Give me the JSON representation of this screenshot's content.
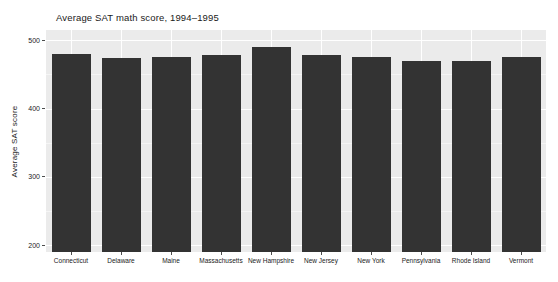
{
  "chart_data": {
    "type": "bar",
    "title": "Average SAT math score, 1994–1995",
    "xlabel": "",
    "ylabel": "Average SAT score",
    "categories": [
      "Connecticut",
      "Delaware",
      "Maine",
      "Massachusetts",
      "New Hampshire",
      "New Jersey",
      "New York",
      "Pennsylvania",
      "Rhode Island",
      "Vermont"
    ],
    "values": [
      480,
      474,
      476,
      478,
      490,
      478,
      476,
      470,
      470,
      476
    ],
    "ylim": [
      190,
      515
    ],
    "ytick_labels": [
      "200",
      "300",
      "400",
      "500"
    ],
    "ytick_values": [
      200,
      300,
      400,
      500
    ],
    "grid": true,
    "legend": "none",
    "bar_color": "#333333",
    "panel_color": "#ebebeb",
    "grid_color": "#ffffff",
    "text_color": "#1a1a1a"
  }
}
